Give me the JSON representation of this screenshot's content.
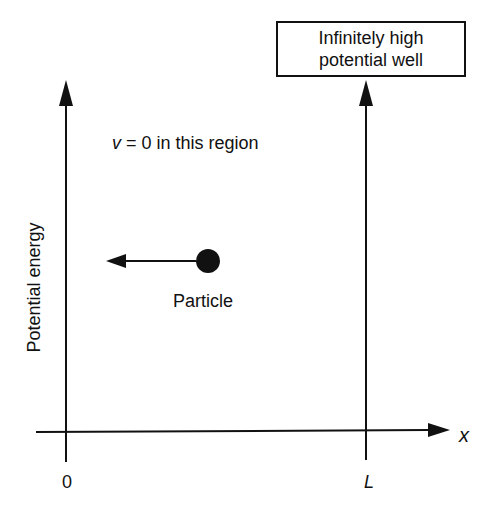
{
  "diagram": {
    "title_box": {
      "line1": "Infinitely high",
      "line2": "potential well"
    },
    "region_label": {
      "var": "v",
      "rest": " = 0 in this region"
    },
    "particle_label": "Particle",
    "y_axis_label": "Potential energy",
    "x_axis_label": "x",
    "x_ticks": [
      "0",
      "L"
    ],
    "colors": {
      "ink": "#111111",
      "background": "#ffffff"
    }
  }
}
